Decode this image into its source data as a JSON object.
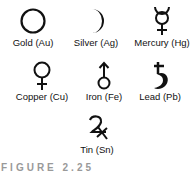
{
  "symbols": [
    {
      "name": "Gold",
      "label": "Gold (Au)",
      "icon": "circle-icon"
    },
    {
      "name": "Silver",
      "label": "Silver (Ag)",
      "icon": "crescent-moon-icon"
    },
    {
      "name": "Mercury",
      "label": "Mercury (Hg)",
      "icon": "mercury-icon"
    },
    {
      "name": "Copper",
      "label": "Copper (Cu)",
      "icon": "venus-icon"
    },
    {
      "name": "Iron",
      "label": "Iron (Fe)",
      "icon": "mars-icon"
    },
    {
      "name": "Lead",
      "label": "Lead (Pb)",
      "icon": "saturn-icon"
    },
    {
      "name": "Tin",
      "label": "Tin (Sn)",
      "icon": "jupiter-icon"
    }
  ],
  "caption": "FIGURE 2.25"
}
